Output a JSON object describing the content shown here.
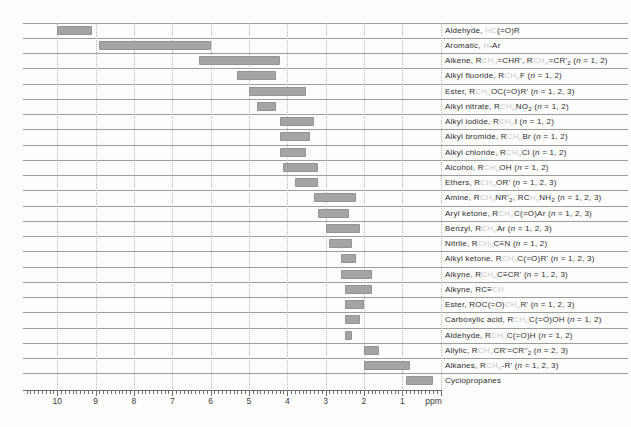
{
  "page": {
    "background": "#fdfdfc",
    "description_visible_title": ""
  },
  "colors": {
    "bar": "#a4a4a4",
    "row_line": "#9d9d9d",
    "gridline": "#bcbcbc",
    "tick": "#6e6e6e",
    "label_text": "#2e2e2e",
    "highlight_faint_text": "#c9c9c9",
    "axis_text": "#3c3c3c"
  },
  "chart_data": {
    "type": "bar",
    "subtype": "horizontal-range-bars",
    "title": "",
    "xlabel": "ppm",
    "grid": "dotted-vertical-at-integer-ppm",
    "axis": {
      "min": 0,
      "max": 10.9,
      "reversed": true,
      "major_ticks": [
        10,
        9,
        8,
        7,
        6,
        5,
        4,
        3,
        2,
        1
      ],
      "minor_tick_step": 0.1,
      "unit_label": "ppm"
    },
    "rows": [
      {
        "id": "aldehyde-hco-r",
        "range_ppm": [
          9.1,
          10.0
        ],
        "text": "Aldehyde, HC(=O)R",
        "segments": [
          {
            "t": "Aldehyde, "
          },
          {
            "t": "HC",
            "f": true
          },
          {
            "t": "(=O)R"
          }
        ]
      },
      {
        "id": "aromatic-h-ar",
        "range_ppm": [
          6.0,
          8.9
        ],
        "text": "Aromatic, H-Ar",
        "segments": [
          {
            "t": "Aromatic, "
          },
          {
            "t": "H",
            "f": true
          },
          {
            "t": "-Ar"
          }
        ]
      },
      {
        "id": "alkene",
        "range_ppm": [
          4.2,
          6.3
        ],
        "text": "Alkene, RCHₙ=CHR', RCHₙ=CR'₂ (n = 1, 2)",
        "segments": [
          {
            "t": "Alkene, R"
          },
          {
            "t": "CH",
            "f": true
          },
          {
            "t": "n",
            "f": true,
            "s": true,
            "i": true
          },
          {
            "t": "=CHR', R"
          },
          {
            "t": "CH",
            "f": true
          },
          {
            "t": "n",
            "f": true,
            "s": true,
            "i": true
          },
          {
            "t": "=CR'"
          },
          {
            "t": "2",
            "s": true
          },
          {
            "t": " ("
          },
          {
            "t": "n",
            "i": true
          },
          {
            "t": " = 1, 2)"
          }
        ]
      },
      {
        "id": "alkyl-fluoride",
        "range_ppm": [
          4.3,
          5.3
        ],
        "text": "Alkyl fluoride, RCHₙF (n = 1, 2)",
        "segments": [
          {
            "t": "Alkyl fluoride, R"
          },
          {
            "t": "CH",
            "f": true
          },
          {
            "t": "n",
            "f": true,
            "s": true,
            "i": true
          },
          {
            "t": "F"
          },
          {
            "t": " ("
          },
          {
            "t": "n",
            "i": true
          },
          {
            "t": " = 1, 2)"
          }
        ]
      },
      {
        "id": "ester-och",
        "range_ppm": [
          3.5,
          5.0
        ],
        "text": "Ester, RCHₙOC(=O)R' (n = 1, 2, 3)",
        "segments": [
          {
            "t": "Ester, R"
          },
          {
            "t": "CH",
            "f": true
          },
          {
            "t": "n",
            "f": true,
            "s": true,
            "i": true
          },
          {
            "t": "OC(=O)R'"
          },
          {
            "t": " ("
          },
          {
            "t": "n",
            "i": true
          },
          {
            "t": " = 1, 2, 3)"
          }
        ]
      },
      {
        "id": "alkyl-nitrate",
        "range_ppm": [
          4.3,
          4.8
        ],
        "text": "Alkyl nitrate, RCHₙNO₂ (n = 1, 2)",
        "segments": [
          {
            "t": "Alkyl nitrate, R"
          },
          {
            "t": "CH",
            "f": true
          },
          {
            "t": "n",
            "f": true,
            "s": true,
            "i": true
          },
          {
            "t": "NO"
          },
          {
            "t": "2",
            "s": true
          },
          {
            "t": " ("
          },
          {
            "t": "n",
            "i": true
          },
          {
            "t": " = 1, 2)"
          }
        ]
      },
      {
        "id": "alkyl-iodide",
        "range_ppm": [
          3.3,
          4.2
        ],
        "text": "Alkyl iodide, RCHₙI (n = 1, 2)",
        "segments": [
          {
            "t": "Alkyl iodide, R"
          },
          {
            "t": "CH",
            "f": true
          },
          {
            "t": "n",
            "f": true,
            "s": true,
            "i": true
          },
          {
            "t": "I"
          },
          {
            "t": " ("
          },
          {
            "t": "n",
            "i": true
          },
          {
            "t": " = 1, 2)"
          }
        ]
      },
      {
        "id": "alkyl-bromide",
        "range_ppm": [
          3.4,
          4.2
        ],
        "text": "Alkyl bromide, RCHₙBr (n = 1, 2)",
        "segments": [
          {
            "t": "Alkyl bromide, R"
          },
          {
            "t": "CH",
            "f": true
          },
          {
            "t": "n",
            "f": true,
            "s": true,
            "i": true
          },
          {
            "t": "Br"
          },
          {
            "t": " ("
          },
          {
            "t": "n",
            "i": true
          },
          {
            "t": " = 1, 2)"
          }
        ]
      },
      {
        "id": "alkyl-chloride",
        "range_ppm": [
          3.5,
          4.2
        ],
        "text": "Alkyl chloride, RCHₙCl (n = 1, 2)",
        "segments": [
          {
            "t": "Alkyl chloride, R"
          },
          {
            "t": "CH",
            "f": true
          },
          {
            "t": "n",
            "f": true,
            "s": true,
            "i": true
          },
          {
            "t": "Cl"
          },
          {
            "t": " ("
          },
          {
            "t": "n",
            "i": true
          },
          {
            "t": " = 1, 2)"
          }
        ]
      },
      {
        "id": "alcohol",
        "range_ppm": [
          3.2,
          4.1
        ],
        "text": "Alcohol, RCHₙOH (n = 1, 2)",
        "segments": [
          {
            "t": "Alcohol, R"
          },
          {
            "t": "CH",
            "f": true
          },
          {
            "t": "n",
            "f": true,
            "s": true,
            "i": true
          },
          {
            "t": "OH"
          },
          {
            "t": " ("
          },
          {
            "t": "n",
            "i": true
          },
          {
            "t": " = 1, 2)"
          }
        ]
      },
      {
        "id": "ethers",
        "range_ppm": [
          3.2,
          3.8
        ],
        "text": "Ethers, RCHₙOR' (n = 1, 2, 3)",
        "segments": [
          {
            "t": "Ethers, R"
          },
          {
            "t": "CH",
            "f": true
          },
          {
            "t": "n",
            "f": true,
            "s": true,
            "i": true
          },
          {
            "t": "OR'"
          },
          {
            "t": " ("
          },
          {
            "t": "n",
            "i": true
          },
          {
            "t": " = 1, 2, 3)"
          }
        ]
      },
      {
        "id": "amine",
        "range_ppm": [
          2.2,
          3.3
        ],
        "text": "Amine, RCHₙNR'₂, RCHₙNH₂ (n = 1, 2, 3)",
        "segments": [
          {
            "t": "Amine, R"
          },
          {
            "t": "CH",
            "f": true
          },
          {
            "t": "n",
            "f": true,
            "s": true,
            "i": true
          },
          {
            "t": "NR'"
          },
          {
            "t": "2",
            "s": true
          },
          {
            "t": ", RC"
          },
          {
            "t": "H",
            "f": true
          },
          {
            "t": "n",
            "f": true,
            "s": true,
            "i": true
          },
          {
            "t": "NH"
          },
          {
            "t": "2",
            "s": true
          },
          {
            "t": " ("
          },
          {
            "t": "n",
            "i": true
          },
          {
            "t": " = 1, 2, 3)"
          }
        ]
      },
      {
        "id": "aryl-ketone",
        "range_ppm": [
          2.4,
          3.2
        ],
        "text": "Aryl ketone, RCHₙC(=O)Ar (n = 1, 2, 3)",
        "segments": [
          {
            "t": "Aryl ketone, R"
          },
          {
            "t": "CH",
            "f": true
          },
          {
            "t": "n",
            "f": true,
            "s": true,
            "i": true
          },
          {
            "t": "C(=O)Ar"
          },
          {
            "t": " ("
          },
          {
            "t": "n",
            "i": true
          },
          {
            "t": " = 1, 2, 3)"
          }
        ]
      },
      {
        "id": "benzyl",
        "range_ppm": [
          2.1,
          3.0
        ],
        "text": "Benzyl, RCHₙAr (n = 1, 2, 3)",
        "segments": [
          {
            "t": "Benzyl, R"
          },
          {
            "t": "CH",
            "f": true
          },
          {
            "t": "n",
            "f": true,
            "s": true,
            "i": true
          },
          {
            "t": "Ar"
          },
          {
            "t": " ("
          },
          {
            "t": "n",
            "i": true
          },
          {
            "t": " = 1, 2, 3)"
          }
        ]
      },
      {
        "id": "nitrile",
        "range_ppm": [
          2.3,
          2.9
        ],
        "text": "Nitrile, RCHₙC≡N (n = 1, 2)",
        "segments": [
          {
            "t": "Nitrile, R"
          },
          {
            "t": "CH",
            "f": true
          },
          {
            "t": "n",
            "f": true,
            "s": true,
            "i": true
          },
          {
            "t": "C≡N"
          },
          {
            "t": " ("
          },
          {
            "t": "n",
            "i": true
          },
          {
            "t": " = 1, 2)"
          }
        ]
      },
      {
        "id": "alkyl-ketone",
        "range_ppm": [
          2.2,
          2.6
        ],
        "text": "Alkyl ketone, RCHₙC(=O)R' (n = 1, 2, 3)",
        "segments": [
          {
            "t": "Alkyl ketone, R"
          },
          {
            "t": "CH",
            "f": true
          },
          {
            "t": "n",
            "f": true,
            "s": true,
            "i": true
          },
          {
            "t": "C(=O)R'"
          },
          {
            "t": " ("
          },
          {
            "t": "n",
            "i": true
          },
          {
            "t": " = 1, 2, 3)"
          }
        ]
      },
      {
        "id": "alkyne-propargylic",
        "range_ppm": [
          1.8,
          2.6
        ],
        "text": "Alkyne, RCHₙC≡CR' (n = 1, 2, 3)",
        "segments": [
          {
            "t": "Alkyne, R"
          },
          {
            "t": "CH",
            "f": true
          },
          {
            "t": "n",
            "f": true,
            "s": true,
            "i": true
          },
          {
            "t": "C≡CR'"
          },
          {
            "t": " ("
          },
          {
            "t": "n",
            "i": true
          },
          {
            "t": " = 1, 2, 3)"
          }
        ]
      },
      {
        "id": "alkyne-terminal",
        "range_ppm": [
          1.8,
          2.5
        ],
        "text": "Alkyne, RC≡CH",
        "segments": [
          {
            "t": "Alkyne, RC≡"
          },
          {
            "t": "CH",
            "f": true
          }
        ]
      },
      {
        "id": "ester-alpha",
        "range_ppm": [
          2.0,
          2.5
        ],
        "text": "Ester, ROC(=O)CHₙR' (n = 1, 2, 3)",
        "segments": [
          {
            "t": "Ester, ROC(=O)"
          },
          {
            "t": "CH",
            "f": true
          },
          {
            "t": "n",
            "f": true,
            "s": true,
            "i": true
          },
          {
            "t": "R'"
          },
          {
            "t": " ("
          },
          {
            "t": "n",
            "i": true
          },
          {
            "t": " = 1, 2, 3)"
          }
        ]
      },
      {
        "id": "carboxylic-acid",
        "range_ppm": [
          2.1,
          2.5
        ],
        "text": "Carboxylic acid, RCHₙC(=O)OH (n = 1, 2)",
        "segments": [
          {
            "t": "Carboxylic acid, R"
          },
          {
            "t": "CH",
            "f": true
          },
          {
            "t": "n",
            "f": true,
            "s": true,
            "i": true
          },
          {
            "t": "C(=O)OH"
          },
          {
            "t": " ("
          },
          {
            "t": "n",
            "i": true
          },
          {
            "t": " = 1, 2)"
          }
        ]
      },
      {
        "id": "aldehyde-alpha",
        "range_ppm": [
          2.3,
          2.5
        ],
        "text": "Aldehyde, RCHₙC(=O)H (n = 1, 2)",
        "segments": [
          {
            "t": "Aldehyde, R"
          },
          {
            "t": "CH",
            "f": true
          },
          {
            "t": "n",
            "f": true,
            "s": true,
            "i": true
          },
          {
            "t": "C(=O)H"
          },
          {
            "t": " ("
          },
          {
            "t": "n",
            "i": true
          },
          {
            "t": " = 1, 2)"
          }
        ]
      },
      {
        "id": "allylic",
        "range_ppm": [
          1.6,
          2.0
        ],
        "text": "Allylic, RCHₙCR'=CR''₂ (n = 2, 3)",
        "segments": [
          {
            "t": "Allylic, R"
          },
          {
            "t": "CH",
            "f": true
          },
          {
            "t": "n",
            "f": true,
            "s": true,
            "i": true
          },
          {
            "t": "CR'=CR''"
          },
          {
            "t": "2",
            "s": true
          },
          {
            "t": " ("
          },
          {
            "t": "n",
            "i": true
          },
          {
            "t": " = 2, 3)"
          }
        ]
      },
      {
        "id": "alkanes",
        "range_ppm": [
          0.8,
          2.0
        ],
        "text": "Alkanes, RCHₙ-R' (n = 1, 2, 3)",
        "segments": [
          {
            "t": "Alkanes, R"
          },
          {
            "t": "CH",
            "f": true
          },
          {
            "t": "n",
            "f": true,
            "s": true,
            "i": true
          },
          {
            "t": "-R'"
          },
          {
            "t": " ("
          },
          {
            "t": "n",
            "i": true
          },
          {
            "t": " = 1, 2, 3)"
          }
        ]
      },
      {
        "id": "cyclopropanes",
        "range_ppm": [
          0.2,
          0.9
        ],
        "text": "Cyclopropanes",
        "segments": [
          {
            "t": "Cyclopropanes"
          }
        ]
      }
    ]
  }
}
